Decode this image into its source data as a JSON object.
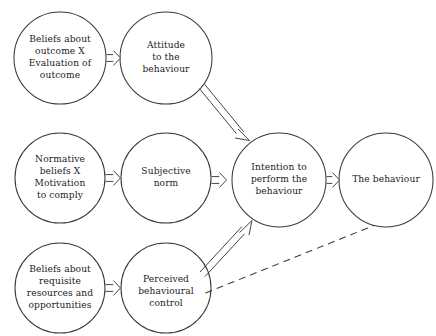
{
  "diagram": {
    "canvas": {
      "width": 436,
      "height": 336,
      "background": "#ffffff"
    },
    "style": {
      "stroke_color": "#3a3a3a",
      "text_color": "#222222",
      "node_fill": "#ffffff",
      "arrow_style": "hollow-open-arrow",
      "dashed_style": "dashed-line-no-head"
    },
    "nodes": [
      {
        "id": "beliefs-outcome",
        "label": "Beliefs about\noutcome X\nEvaluation of\noutcome",
        "lines": [
          "Beliefs about",
          "outcome X",
          "Evaluation of",
          "outcome"
        ],
        "cx": 60,
        "cy": 58,
        "r": 46
      },
      {
        "id": "attitude",
        "label": "Attitude\nto the\nbehaviour",
        "lines": [
          "Attitude",
          "to the",
          "behaviour"
        ],
        "cx": 166,
        "cy": 58,
        "r": 46
      },
      {
        "id": "normative-beliefs",
        "label": "Normative\nbeliefs X\nMotivation\nto comply",
        "lines": [
          "Normative",
          "beliefs X",
          "Motivation",
          "to comply"
        ],
        "cx": 60,
        "cy": 178,
        "r": 45
      },
      {
        "id": "subjective-norm",
        "label": "Subjective\nnorm",
        "lines": [
          "Subjective",
          "norm"
        ],
        "cx": 166,
        "cy": 178,
        "r": 45
      },
      {
        "id": "beliefs-resources",
        "label": "Beliefs about\nrequisite\nresources and\nopportunities",
        "lines": [
          "Beliefs about",
          "requisite",
          "resources and",
          "opportunities"
        ],
        "cx": 60,
        "cy": 288,
        "r": 45
      },
      {
        "id": "perceived-control",
        "label": "Perceived\nbehavioural\ncontrol",
        "lines": [
          "Perceived",
          "behavioural",
          "control"
        ],
        "cx": 166,
        "cy": 288,
        "r": 45
      },
      {
        "id": "intention",
        "label": "Intention to\nperform the\nbehaviour",
        "lines": [
          "Intention to",
          "perform the",
          "behaviour"
        ],
        "cx": 279,
        "cy": 180,
        "r": 47
      },
      {
        "id": "the-behaviour",
        "label": "The behaviour",
        "lines": [
          "The behaviour"
        ],
        "cx": 386,
        "cy": 180,
        "r": 47
      }
    ],
    "edges": [
      {
        "id": "e1",
        "from": "beliefs-outcome",
        "to": "attitude",
        "kind": "solid-hollow-arrow"
      },
      {
        "id": "e2",
        "from": "normative-beliefs",
        "to": "subjective-norm",
        "kind": "solid-hollow-arrow"
      },
      {
        "id": "e3",
        "from": "beliefs-resources",
        "to": "perceived-control",
        "kind": "solid-hollow-arrow"
      },
      {
        "id": "e4",
        "from": "attitude",
        "to": "intention",
        "kind": "solid-hollow-arrow"
      },
      {
        "id": "e5",
        "from": "subjective-norm",
        "to": "intention",
        "kind": "solid-hollow-arrow"
      },
      {
        "id": "e6",
        "from": "perceived-control",
        "to": "intention",
        "kind": "solid-hollow-arrow"
      },
      {
        "id": "e7",
        "from": "intention",
        "to": "the-behaviour",
        "kind": "solid-hollow-arrow"
      },
      {
        "id": "e8",
        "from": "perceived-control",
        "to": "the-behaviour",
        "kind": "dashed-line"
      }
    ]
  }
}
